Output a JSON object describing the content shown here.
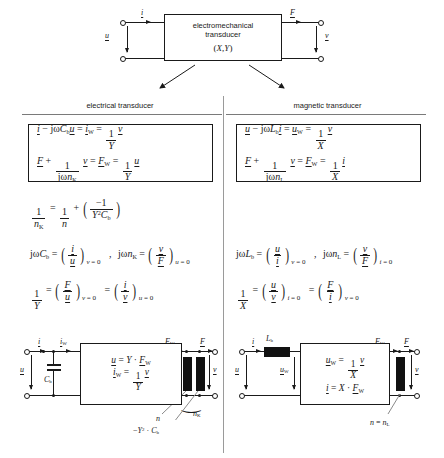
{
  "figure": {
    "top_block": {
      "line1": "electromechanical",
      "line2": "transducer",
      "line3": "(X,Y)",
      "port_labels": {
        "in_current": "i",
        "in_voltage": "u",
        "out_force": "F",
        "out_velocity": "v"
      }
    },
    "columns": [
      {
        "id": "electrical",
        "header": "electrical transducer",
        "equation_box": [
          "i − jωC_b u = i_W = (1/Y) v",
          "F + (1/(jω n_K)) v = F_W = (1/Y) u"
        ],
        "relations": [
          "1/n_K = 1/n + ( −1 / (Y² C_b) )",
          "jωC_b = ( i / u )_{v = 0}   ,   jω n_K = ( v / F )_{u = 0}",
          "1/Y = ( F / u )_{v = 0} = ( i / v )_{u = 0}"
        ],
        "circuit": {
          "box_lines": [
            "u = Y · F_W",
            "i_W = (1/Y) v"
          ],
          "labels": {
            "i": "i",
            "iw": "i_W",
            "u": "u",
            "v": "v",
            "Fw": "F_W",
            "F": "F",
            "cap": "C_b",
            "n": "n",
            "nK": "n_K",
            "neg": "−Y² · C_b"
          }
        }
      },
      {
        "id": "magnetic",
        "header": "magnetic transducer",
        "equation_box": [
          "u − jωL_b i = u_W = (1/X) v",
          "F + (1/(jω n_L)) v = F_W = (1/X) i"
        ],
        "relations": [
          "jωL_b = ( u / i )_{v = 0}   ,   jω n_L = ( v / F )_{i = 0}",
          "1/X = ( u / v )_{i = 0} = ( F / i )_{v = 0}"
        ],
        "circuit": {
          "box_lines": [
            "u_W = (1/X) v",
            "i = X · F_W"
          ],
          "labels": {
            "i": "i",
            "u": "u",
            "uw": "u_W",
            "v": "v",
            "Fw": "F_W",
            "F": "F",
            "ind": "L_b",
            "n": "n = n_L"
          }
        }
      }
    ],
    "symbols": {
      "i": "i",
      "u": "u",
      "v": "v",
      "F": "F",
      "iW": "i",
      "iW_sub": "W",
      "uW": "u",
      "uW_sub": "W",
      "FW": "F",
      "FW_sub": "W",
      "Y": "Y",
      "X": "X",
      "Cb": "C",
      "Cb_sub": "b",
      "Lb": "L",
      "Lb_sub": "b",
      "n": "n",
      "nK_sub": "K",
      "nL_sub": "L",
      "omega": "ω",
      "jw": "jω",
      "one": "1",
      "minus_one": "−1",
      "zero": "0",
      "eq": "=",
      "plus": "+",
      "minus": "−",
      "comma": ",",
      "dot": "·",
      "Y2": "Y",
      "sq": "2"
    },
    "colors": {
      "line": "#1a1a1a",
      "rule": "#7a7a7a",
      "fill": "#111111",
      "background": "#ffffff"
    }
  }
}
